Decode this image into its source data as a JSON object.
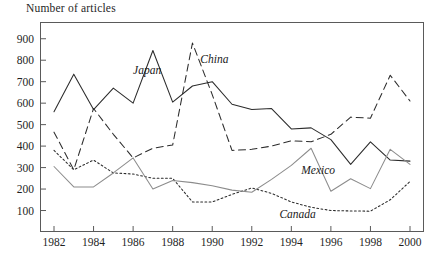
{
  "chart_data": {
    "type": "line",
    "title": "Number of articles",
    "ylabel": "Number of articles",
    "xlabel": "",
    "grid": false,
    "legend_position": "inline-annotations",
    "ylim": [
      0,
      950
    ],
    "xlim": [
      1982,
      2000
    ],
    "ytick_values": [
      100,
      200,
      300,
      400,
      500,
      600,
      700,
      800,
      900
    ],
    "ytick_labels": [
      "100",
      "200",
      "300",
      "400",
      "500",
      "600",
      "700",
      "800",
      "900"
    ],
    "xtick_values": [
      1982,
      1984,
      1986,
      1988,
      1990,
      1992,
      1994,
      1996,
      1998,
      2000
    ],
    "xtick_labels": [
      "1982",
      "1984",
      "1986",
      "1988",
      "1990",
      "1992",
      "1994",
      "1996",
      "1998",
      "2000"
    ],
    "x": [
      1982,
      1983,
      1984,
      1985,
      1986,
      1987,
      1988,
      1989,
      1990,
      1991,
      1992,
      1993,
      1994,
      1995,
      1996,
      1997,
      1998,
      1999,
      2000
    ],
    "series": [
      {
        "name": "Japan",
        "style": "solid",
        "color": "#2b2b2b",
        "label_x": 1986.0,
        "label_y": 745,
        "values": [
          560,
          735,
          570,
          670,
          600,
          845,
          605,
          680,
          700,
          595,
          570,
          575,
          480,
          485,
          430,
          315,
          420,
          335,
          330
        ]
      },
      {
        "name": "China",
        "style": "dashed",
        "color": "#2b2b2b",
        "label_x": 1989.4,
        "label_y": 795,
        "values": [
          465,
          290,
          575,
          455,
          345,
          390,
          405,
          880,
          640,
          380,
          385,
          400,
          425,
          420,
          455,
          535,
          530,
          730,
          610
        ]
      },
      {
        "name": "Canada",
        "style": "dotted",
        "color": "#2b2b2b",
        "label_x": 1993.4,
        "label_y": 75,
        "values": [
          380,
          290,
          335,
          275,
          270,
          250,
          250,
          140,
          140,
          175,
          205,
          180,
          140,
          115,
          100,
          98,
          97,
          150,
          235
        ]
      },
      {
        "name": "Mexico",
        "style": "solid",
        "color": "#8c8c8c",
        "label_x": 1994.5,
        "label_y": 278,
        "values": [
          305,
          210,
          210,
          275,
          345,
          200,
          240,
          230,
          215,
          195,
          185,
          245,
          310,
          390,
          190,
          248,
          202,
          385,
          315
        ]
      }
    ]
  }
}
